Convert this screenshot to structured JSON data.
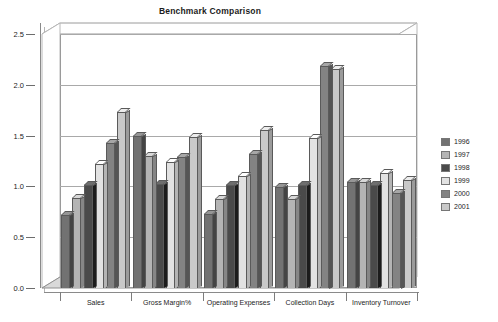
{
  "chart_data": {
    "type": "bar",
    "title": "Benchmark Comparison",
    "xlabel": "",
    "ylabel": "",
    "ylim": [
      0.0,
      2.5
    ],
    "ytick_labels": [
      "0.0",
      "0.5",
      "1.0",
      "1.5",
      "2.0",
      "2.5"
    ],
    "ytick_values": [
      0.0,
      0.5,
      1.0,
      1.5,
      2.0,
      2.5
    ],
    "grid": true,
    "legend_position": "right",
    "three_d": true,
    "categories": [
      "Sales",
      "Gross Margin%",
      "Operating Expenses",
      "Collection Days",
      "Inventory Turnover"
    ],
    "series": [
      {
        "name": "1996",
        "color": "#727272",
        "values": [
          0.72,
          1.5,
          0.73,
          0.99,
          1.04
        ]
      },
      {
        "name": "1997",
        "color": "#b4b4b4",
        "values": [
          0.89,
          1.3,
          0.88,
          0.88,
          1.04
        ]
      },
      {
        "name": "1998",
        "color": "#4a4a4a",
        "values": [
          1.01,
          1.02,
          1.01,
          1.01,
          1.01
        ]
      },
      {
        "name": "1999",
        "color": "#e2e2e2",
        "values": [
          1.22,
          1.24,
          1.1,
          1.48,
          1.13
        ]
      },
      {
        "name": "2000",
        "color": "#838383",
        "values": [
          1.43,
          1.29,
          1.32,
          2.19,
          0.94
        ]
      },
      {
        "name": "2001",
        "color": "#c9c9c9",
        "values": [
          1.73,
          1.49,
          1.56,
          2.16,
          1.06
        ]
      }
    ]
  },
  "legend": {
    "items": [
      {
        "label": "1996"
      },
      {
        "label": "1997"
      },
      {
        "label": "1998"
      },
      {
        "label": "1999"
      },
      {
        "label": "2000"
      },
      {
        "label": "2001"
      }
    ]
  }
}
